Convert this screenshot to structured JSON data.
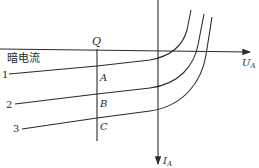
{
  "diagram": {
    "type": "photodiode I-V characteristic curves",
    "axes": {
      "x": {
        "label": "U",
        "subscript": "A"
      },
      "y": {
        "label": "I",
        "subscript": "A"
      }
    },
    "dark_current_label": "暗电流",
    "vertical_line_label": "Q",
    "curves": [
      {
        "id": "1",
        "label": "1",
        "point": "A"
      },
      {
        "id": "2",
        "label": "2",
        "point": "B"
      },
      {
        "id": "3",
        "label": "3",
        "point": "C"
      }
    ],
    "colors": {
      "line": "#2a2a2a",
      "background": "#ffffff"
    }
  }
}
